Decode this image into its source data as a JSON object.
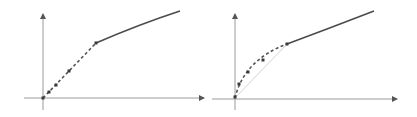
{
  "colors": {
    "axis": "#9a9a9a",
    "curve": "#4a4a4a",
    "dash": "#555555",
    "chord": "#d4d4d4",
    "point": "#3a3a3a",
    "background": "#ffffff"
  },
  "panels": [
    {
      "id": "left",
      "origin": [
        43,
        98
      ],
      "x_axis_end": [
        204,
        98
      ],
      "x_axis_start": [
        24,
        98
      ],
      "y_axis_end": [
        43,
        14
      ],
      "y_axis_start": [
        43,
        110
      ],
      "dashed_segment": {
        "from": [
          43,
          98
        ],
        "to": [
          96,
          43
        ],
        "shape": "line"
      },
      "solid_curve": {
        "from": [
          96,
          43
        ],
        "control": [
          140,
          24
        ],
        "to": [
          180,
          11
        ]
      },
      "points": [
        [
          43,
          98
        ],
        [
          49,
          92
        ],
        [
          56,
          85
        ],
        [
          69,
          71
        ],
        [
          96,
          43
        ]
      ]
    },
    {
      "id": "right",
      "origin": [
        235,
        98
      ],
      "x_axis_end": [
        397,
        99
      ],
      "x_axis_start": [
        212,
        99
      ],
      "y_axis_end": [
        235,
        14
      ],
      "y_axis_start": [
        235,
        110
      ],
      "chord": {
        "from": [
          235,
          98
        ],
        "to": [
          287,
          44
        ]
      },
      "dashed_segment": {
        "from": [
          235,
          98
        ],
        "control": [
          244,
          60
        ],
        "to": [
          287,
          44
        ],
        "shape": "curve"
      },
      "solid_curve": {
        "from": [
          287,
          44
        ],
        "control": [
          330,
          28
        ],
        "to": [
          374,
          11
        ]
      },
      "points": [
        [
          235,
          97
        ],
        [
          239,
          84
        ],
        [
          248,
          72
        ],
        [
          263,
          60
        ],
        [
          287,
          44
        ]
      ]
    }
  ]
}
